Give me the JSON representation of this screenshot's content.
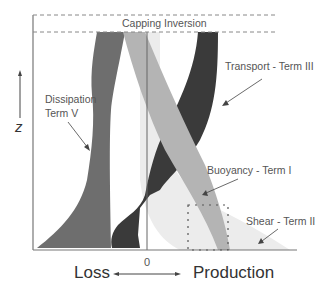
{
  "diagram": {
    "type": "turbulent kinetic energy budget profile",
    "labels": {
      "capping_inversion": "Capping Inversion",
      "transport": "Transport - Term III",
      "dissipation_line1": "Dissipation",
      "dissipation_line2": "Term V",
      "buoyancy": "Buoyancy - Term I",
      "shear": "Shear - Term II",
      "z_axis": "z",
      "zero": "0",
      "loss": "Loss",
      "production": "Production"
    },
    "colors": {
      "dissipation": "#6e6e6e",
      "transport": "#3a3a3a",
      "buoyancy": "#b4b4b4",
      "shear": "#ececec",
      "axis": "#777777",
      "text": "#555555"
    },
    "terms": [
      {
        "name": "Buoyancy",
        "term": "I",
        "side": "Production"
      },
      {
        "name": "Shear",
        "term": "II",
        "side": "Production"
      },
      {
        "name": "Transport",
        "term": "III",
        "side": "Loss/Production"
      },
      {
        "name": "Dissipation",
        "term": "V",
        "side": "Loss"
      }
    ]
  }
}
